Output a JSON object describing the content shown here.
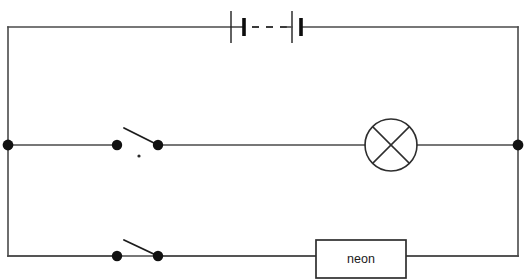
{
  "diagram": {
    "type": "electrical-schematic",
    "canvas": {
      "width": 527,
      "height": 280
    },
    "background_color": "#ffffff",
    "wire_color": "#4a4a4a",
    "ink_color": "#1a1a1a"
  },
  "loop": {
    "left_x": 8,
    "right_x": 518,
    "top_y": 27,
    "bottom_y": 256
  },
  "battery": {
    "label": "",
    "cells": [
      {
        "long_plate_x": 231,
        "short_plate_x": 244
      },
      {
        "long_plate_x": 292,
        "short_plate_x": 301
      }
    ],
    "dash_from_x": 252,
    "dash_to_x": 285,
    "long_plate_half_height": 16,
    "short_plate_half_height": 9,
    "y": 34
  },
  "branches": {
    "middle": {
      "y": 145,
      "left_node_x": 8,
      "right_node_x": 518,
      "switch": {
        "name": "switch-1",
        "state": "open",
        "left_contact_x": 117,
        "pivot_x": 158,
        "blade_tip_x": 124,
        "blade_tip_y": 128,
        "contact_radius": 5.2
      },
      "lamp": {
        "name": "lamp",
        "center_x": 391,
        "center_y": 145,
        "radius": 26
      }
    },
    "bottom": {
      "y": 256,
      "switch": {
        "name": "switch-2",
        "state": "open",
        "left_contact_x": 117,
        "pivot_x": 158,
        "blade_tip_x": 124,
        "blade_tip_y": 240,
        "contact_radius": 5.2
      },
      "component_box": {
        "label": "neon",
        "x": 316,
        "y": 240,
        "width": 90,
        "height": 38
      }
    }
  },
  "nodes": [
    {
      "name": "junction-left",
      "x": 8,
      "y": 145,
      "radius": 5.4
    },
    {
      "name": "junction-right",
      "x": 518,
      "y": 145,
      "radius": 5.4
    }
  ],
  "artifacts": [
    {
      "name": "ink-speck",
      "x": 139,
      "y": 156,
      "radius": 1.6
    }
  ]
}
